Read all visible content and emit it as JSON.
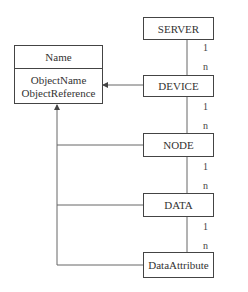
{
  "name_class": {
    "title": "Name",
    "attributes": [
      "ObjectName",
      "ObjectReference"
    ]
  },
  "hierarchy": [
    {
      "label": "SERVER"
    },
    {
      "label": "DEVICE"
    },
    {
      "label": "NODE"
    },
    {
      "label": "DATA"
    },
    {
      "label": "DataAttribute"
    }
  ],
  "links": [
    {
      "from": "SERVER",
      "to": "DEVICE",
      "from_card": "1",
      "to_card": "n"
    },
    {
      "from": "DEVICE",
      "to": "NODE",
      "from_card": "1",
      "to_card": "n"
    },
    {
      "from": "NODE",
      "to": "DATA",
      "from_card": "1",
      "to_card": "n"
    },
    {
      "from": "DATA",
      "to": "DataAttribute",
      "from_card": "1",
      "to_card": "n"
    }
  ],
  "inherits_from_name": [
    "DEVICE",
    "NODE",
    "DATA",
    "DataAttribute"
  ],
  "colors": {
    "line": "#555555",
    "border": "#444444",
    "text": "#333333"
  }
}
